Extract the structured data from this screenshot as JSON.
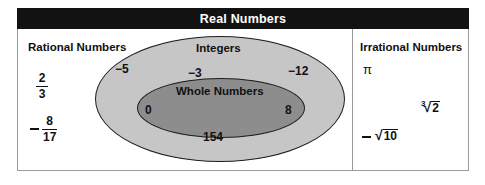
{
  "figure": {
    "title": "Real Numbers",
    "type": "nested-venn-diagram"
  },
  "sets": {
    "rational": {
      "label": "Rational Numbers",
      "members": [
        {
          "name": "two-thirds",
          "numerator": "2",
          "denominator": "3"
        },
        {
          "name": "negative-eight-seventeenths",
          "sign": "−",
          "numerator": "8",
          "denominator": "17"
        }
      ]
    },
    "integers": {
      "label": "Integers",
      "members": [
        "−5",
        "−3",
        "−12"
      ]
    },
    "whole": {
      "label": "Whole Numbers",
      "members": [
        "0",
        "8",
        "154"
      ]
    },
    "irrational": {
      "label": "Irrational Numbers",
      "members": [
        {
          "name": "pi",
          "text": "π"
        },
        {
          "name": "cube-root-of-two",
          "index": "3",
          "radicand": "2"
        },
        {
          "name": "negative-square-root-of-ten",
          "sign": "−",
          "radicand": "10"
        }
      ]
    }
  },
  "values": {
    "neg5": "−5",
    "neg3": "−3",
    "neg12": "−12",
    "zero": "0",
    "eight": "8",
    "one_five_four": "154",
    "pi": "π",
    "cbrt_index": "3",
    "cbrt_radicand": "2",
    "sqrt_ten_radicand": "10",
    "radical_sign": "√",
    "two": "2",
    "three": "3",
    "eight_numer": "8",
    "seventeen_denom": "17"
  },
  "colors": {
    "title_bar": "#121212",
    "title_text": "#ffffff",
    "integers_fill": "#c6c6c6",
    "whole_fill": "#8d8d8d",
    "outline": "#1d1d1d",
    "frame_border": "#9a9a9a",
    "text": "#111111",
    "page_background": "#ffffff"
  }
}
